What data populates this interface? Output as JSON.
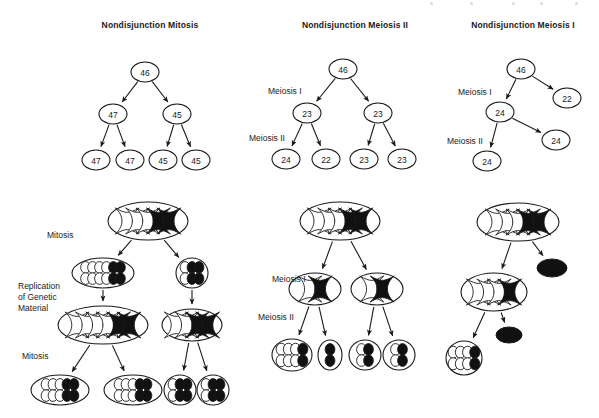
{
  "figure": {
    "background": "#ffffff",
    "ink": "#1a1a1a",
    "chromosome_white_fill": "#ffffff",
    "chromosome_black_fill": "#111111"
  },
  "columns": [
    {
      "id": "mitosis",
      "title": "Nondisjunction Mitosis",
      "title_x": 150,
      "title_y": 26,
      "tree": {
        "nodes": [
          {
            "id": "m0",
            "label": "46",
            "cx": 145,
            "cy": 72,
            "rx": 14,
            "ry": 10
          },
          {
            "id": "m1",
            "label": "47",
            "cx": 113,
            "cy": 114,
            "rx": 14,
            "ry": 10
          },
          {
            "id": "m2",
            "label": "45",
            "cx": 177,
            "cy": 114,
            "rx": 14,
            "ry": 10
          },
          {
            "id": "m3",
            "label": "47",
            "cx": 96,
            "cy": 160,
            "rx": 14,
            "ry": 10
          },
          {
            "id": "m4",
            "label": "47",
            "cx": 130,
            "cy": 160,
            "rx": 14,
            "ry": 10
          },
          {
            "id": "m5",
            "label": "45",
            "cx": 163,
            "cy": 160,
            "rx": 14,
            "ry": 10
          },
          {
            "id": "m6",
            "label": "45",
            "cx": 196,
            "cy": 160,
            "rx": 14,
            "ry": 10
          }
        ],
        "edges": [
          {
            "from": "m0",
            "to": "m1"
          },
          {
            "from": "m0",
            "to": "m2"
          },
          {
            "from": "m1",
            "to": "m3"
          },
          {
            "from": "m1",
            "to": "m4"
          },
          {
            "from": "m2",
            "to": "m5"
          },
          {
            "from": "m2",
            "to": "m6"
          }
        ]
      },
      "side_labels": [
        {
          "text": "Mitosis",
          "x": 47,
          "y": 236
        },
        {
          "text": "Replication",
          "x": 18,
          "y": 287
        },
        {
          "text": "of Genetic",
          "x": 18,
          "y": 298
        },
        {
          "text": "Material",
          "x": 18,
          "y": 309
        },
        {
          "text": "Mitosis",
          "x": 22,
          "y": 357
        }
      ],
      "cells": [
        {
          "id": "c0",
          "cx": 148,
          "cy": 221,
          "rx": 40,
          "ry": 19,
          "white": 3,
          "black": 2,
          "style": "x"
        },
        {
          "id": "c1",
          "cx": 103,
          "cy": 273,
          "rx": 31,
          "ry": 15,
          "white": 4,
          "black": 2,
          "style": "rod"
        },
        {
          "id": "c2",
          "cx": 192,
          "cy": 273,
          "rx": 16,
          "ry": 15,
          "white": 1,
          "black": 2,
          "style": "rod"
        },
        {
          "id": "c3",
          "cx": 103,
          "cy": 325,
          "rx": 45,
          "ry": 19,
          "white": 4,
          "black": 2,
          "style": "x"
        },
        {
          "id": "c4",
          "cx": 192,
          "cy": 325,
          "rx": 30,
          "ry": 16,
          "white": 2,
          "black": 2,
          "style": "x"
        },
        {
          "id": "c5",
          "cx": 60,
          "cy": 390,
          "rx": 29,
          "ry": 15,
          "white": 3,
          "black": 2,
          "style": "rod"
        },
        {
          "id": "c6",
          "cx": 133,
          "cy": 390,
          "rx": 29,
          "ry": 15,
          "white": 3,
          "black": 2,
          "style": "rod"
        },
        {
          "id": "c7",
          "cx": 180,
          "cy": 390,
          "rx": 16,
          "ry": 15,
          "white": 1,
          "black": 2,
          "style": "rod"
        },
        {
          "id": "c8",
          "cx": 213,
          "cy": 390,
          "rx": 16,
          "ry": 15,
          "white": 1,
          "black": 2,
          "style": "rod"
        }
      ],
      "cell_edges": [
        {
          "from": "c0",
          "to": "c1"
        },
        {
          "from": "c0",
          "to": "c2"
        },
        {
          "from": "c1",
          "to": "c3"
        },
        {
          "from": "c2",
          "to": "c4"
        },
        {
          "from": "c3",
          "to": "c5"
        },
        {
          "from": "c3",
          "to": "c6"
        },
        {
          "from": "c4",
          "to": "c7"
        },
        {
          "from": "c4",
          "to": "c8"
        }
      ]
    },
    {
      "id": "meiosis2",
      "title": "Nondisjunction Meiosis II",
      "title_x": 355,
      "title_y": 26,
      "tree": {
        "nodes": [
          {
            "id": "n0",
            "label": "46",
            "cx": 343,
            "cy": 69,
            "rx": 14,
            "ry": 10
          },
          {
            "id": "n1",
            "label": "23",
            "cx": 307,
            "cy": 113,
            "rx": 14,
            "ry": 10
          },
          {
            "id": "n2",
            "label": "23",
            "cx": 378,
            "cy": 113,
            "rx": 14,
            "ry": 10
          },
          {
            "id": "n3",
            "label": "24",
            "cx": 286,
            "cy": 159,
            "rx": 14,
            "ry": 10
          },
          {
            "id": "n4",
            "label": "22",
            "cx": 326,
            "cy": 159,
            "rx": 14,
            "ry": 10
          },
          {
            "id": "n5",
            "label": "23",
            "cx": 364,
            "cy": 159,
            "rx": 14,
            "ry": 10
          },
          {
            "id": "n6",
            "label": "23",
            "cx": 402,
            "cy": 159,
            "rx": 14,
            "ry": 10
          }
        ],
        "edges": [
          {
            "from": "n0",
            "to": "n1"
          },
          {
            "from": "n0",
            "to": "n2"
          },
          {
            "from": "n1",
            "to": "n3"
          },
          {
            "from": "n1",
            "to": "n4"
          },
          {
            "from": "n2",
            "to": "n5"
          },
          {
            "from": "n2",
            "to": "n6"
          }
        ]
      },
      "tree_labels": [
        {
          "text": "Meiosis I",
          "x": 268,
          "y": 92
        },
        {
          "text": "Meiosis II",
          "x": 249,
          "y": 139
        }
      ],
      "side_labels": [
        {
          "text": "Meiosis I",
          "x": 272,
          "y": 280
        },
        {
          "text": "Meiosis II",
          "x": 258,
          "y": 318
        }
      ],
      "cells": [
        {
          "id": "d0",
          "cx": 340,
          "cy": 221,
          "rx": 40,
          "ry": 19,
          "white": 3,
          "black": 2,
          "style": "x"
        },
        {
          "id": "d1",
          "cx": 315,
          "cy": 289,
          "rx": 26,
          "ry": 16,
          "white": 1,
          "black": 1,
          "style": "x"
        },
        {
          "id": "d2",
          "cx": 377,
          "cy": 289,
          "rx": 26,
          "ry": 16,
          "white": 1,
          "black": 1,
          "style": "x"
        },
        {
          "id": "d3",
          "cx": 292,
          "cy": 355,
          "rx": 20,
          "ry": 16,
          "white": 3,
          "black": 1,
          "style": "rod"
        },
        {
          "id": "d4",
          "cx": 330,
          "cy": 355,
          "rx": 12,
          "ry": 15,
          "white": 0,
          "black": 1,
          "style": "rod"
        },
        {
          "id": "d5",
          "cx": 365,
          "cy": 355,
          "rx": 16,
          "ry": 15,
          "white": 1,
          "black": 1,
          "style": "rod"
        },
        {
          "id": "d6",
          "cx": 399,
          "cy": 355,
          "rx": 16,
          "ry": 15,
          "white": 1,
          "black": 1,
          "style": "rod"
        }
      ],
      "cell_edges": [
        {
          "from": "d0",
          "to": "d1"
        },
        {
          "from": "d0",
          "to": "d2"
        },
        {
          "from": "d1",
          "to": "d3"
        },
        {
          "from": "d1",
          "to": "d4"
        },
        {
          "from": "d2",
          "to": "d5"
        },
        {
          "from": "d2",
          "to": "d6"
        }
      ]
    },
    {
      "id": "meiosis1",
      "title": "Nondisjunction Meiosis I",
      "title_x": 523,
      "title_y": 26,
      "tree": {
        "nodes": [
          {
            "id": "p0",
            "label": "46",
            "cx": 521,
            "cy": 69,
            "rx": 14,
            "ry": 10
          },
          {
            "id": "p1",
            "label": "22",
            "cx": 567,
            "cy": 98,
            "rx": 14,
            "ry": 10
          },
          {
            "id": "p2",
            "label": "24",
            "cx": 500,
            "cy": 112,
            "rx": 14,
            "ry": 10
          },
          {
            "id": "p3",
            "label": "24",
            "cx": 556,
            "cy": 140,
            "rx": 14,
            "ry": 10
          },
          {
            "id": "p4",
            "label": "24",
            "cx": 487,
            "cy": 161,
            "rx": 14,
            "ry": 10
          }
        ],
        "edges": [
          {
            "from": "p0",
            "to": "p1"
          },
          {
            "from": "p0",
            "to": "p2"
          },
          {
            "from": "p2",
            "to": "p3"
          },
          {
            "from": "p2",
            "to": "p4"
          }
        ]
      },
      "tree_labels": [
        {
          "text": "Meiosis I",
          "x": 458,
          "y": 93
        },
        {
          "text": "Meiosis II",
          "x": 447,
          "y": 142
        }
      ],
      "cells": [
        {
          "id": "e0",
          "cx": 518,
          "cy": 222,
          "rx": 41,
          "ry": 19,
          "white": 3,
          "black": 2,
          "style": "x"
        },
        {
          "id": "e1",
          "cx": 552,
          "cy": 268,
          "rx": 15,
          "ry": 9,
          "polar": true
        },
        {
          "id": "e2",
          "cx": 494,
          "cy": 292,
          "rx": 33,
          "ry": 19,
          "white": 3,
          "black": 1,
          "style": "x"
        },
        {
          "id": "e3",
          "cx": 509,
          "cy": 335,
          "rx": 13,
          "ry": 8,
          "polar": true
        },
        {
          "id": "e4",
          "cx": 464,
          "cy": 358,
          "rx": 18,
          "ry": 17,
          "white": 3,
          "black": 1,
          "style": "rod"
        }
      ],
      "cell_edges": [
        {
          "from": "e0",
          "to": "e1"
        },
        {
          "from": "e0",
          "to": "e2"
        },
        {
          "from": "e2",
          "to": "e3"
        },
        {
          "from": "e2",
          "to": "e4"
        }
      ]
    }
  ],
  "scan_flecks": [
    {
      "x": 430
    },
    {
      "x": 470
    },
    {
      "x": 512
    },
    {
      "x": 540
    },
    {
      "x": 575
    }
  ]
}
